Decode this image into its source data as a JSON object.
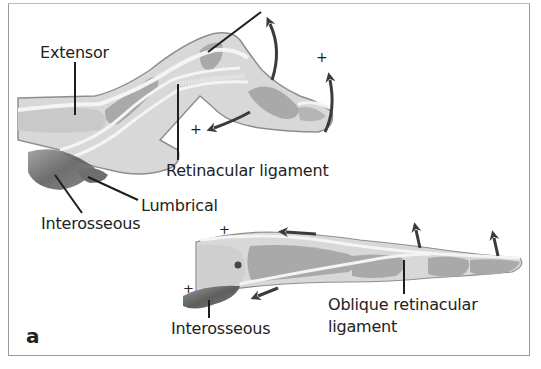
{
  "figure": {
    "panel_letter": "a",
    "colors": {
      "skin": "#d8d8d8",
      "skin_outline": "#8e8e8e",
      "bone": "#a9a9a9",
      "tendon": "#f4f4f4",
      "muscle": "#6e6e6e",
      "arrow": "#3b3b3b",
      "leader": "#1e1e1e",
      "border": "#9a9a9a"
    },
    "top_diagram": {
      "labels": {
        "extensor": "Extensor",
        "retinacular": "Retinacular ligament",
        "lumbrical": "Lumbrical",
        "interosseous": "Interosseous"
      },
      "plus_marks": [
        "+",
        "+"
      ]
    },
    "bottom_diagram": {
      "labels": {
        "interosseous": "Interosseous",
        "oblique_line1": "Oblique retinacular",
        "oblique_line2": "ligament"
      },
      "plus_marks": [
        "+",
        "+"
      ]
    }
  }
}
